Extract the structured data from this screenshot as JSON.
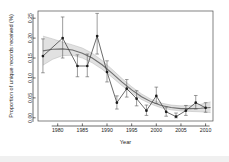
{
  "figure": {
    "background_color": "#ffffff",
    "bottom_band_color": "#f0f0f0"
  },
  "chart_data": {
    "type": "line",
    "title": "",
    "xlabel": "Year",
    "ylabel": "Proportion of unique records received (%)",
    "xlim": [
      1976,
      2011.5
    ],
    "ylim": [
      -0.008,
      0.268
    ],
    "grid": false,
    "legend": null,
    "xticks": [
      1980,
      1985,
      1990,
      1995,
      2000,
      2005,
      2010
    ],
    "xticklabels": [
      "1980",
      "1985",
      "1990",
      "1995",
      "2000",
      "2005",
      "2010"
    ],
    "yticks": [
      0.0,
      0.05,
      0.1,
      0.15,
      0.2,
      0.25
    ],
    "yticklabels": [
      "0.00",
      "0.05",
      "0.10",
      "0.15",
      "0.20",
      "0.25"
    ],
    "series": [
      {
        "name": "observed",
        "style": "line-with-points-and-errorbars",
        "color": "#1c1c1c",
        "x": [
          1977,
          1981,
          1984,
          1986,
          1988,
          1990,
          1992,
          1994,
          1996,
          1998,
          2000,
          2002,
          2004,
          2006,
          2008,
          2010
        ],
        "y": [
          0.155,
          0.2,
          0.13,
          0.13,
          0.205,
          0.115,
          0.038,
          0.073,
          0.048,
          0.018,
          0.055,
          0.015,
          0.003,
          0.018,
          0.038,
          0.025
        ],
        "yerr_low": [
          0.113,
          0.15,
          0.103,
          0.103,
          0.16,
          0.09,
          0.022,
          0.052,
          0.03,
          0.006,
          0.036,
          0.004,
          0.0,
          0.006,
          0.022,
          0.014
        ],
        "yerr_high": [
          0.198,
          0.253,
          0.158,
          0.16,
          0.262,
          0.143,
          0.055,
          0.096,
          0.068,
          0.032,
          0.077,
          0.027,
          0.012,
          0.031,
          0.056,
          0.038
        ]
      },
      {
        "name": "fitted-smooth",
        "style": "line",
        "color": "#6e6e6e",
        "x": [
          1977,
          1979,
          1981,
          1983,
          1985,
          1987,
          1989,
          1991,
          1993,
          1995,
          1997,
          1999,
          2001,
          2003,
          2005,
          2007,
          2009,
          2011
        ],
        "y": [
          0.168,
          0.172,
          0.173,
          0.17,
          0.162,
          0.15,
          0.133,
          0.112,
          0.09,
          0.07,
          0.053,
          0.04,
          0.031,
          0.026,
          0.023,
          0.023,
          0.024,
          0.026
        ]
      },
      {
        "name": "confidence-band",
        "style": "shaded-ribbon",
        "color": "#c9c9c9",
        "x": [
          1977,
          1979,
          1981,
          1983,
          1985,
          1987,
          1989,
          1991,
          1993,
          1995,
          1997,
          1999,
          2001,
          2003,
          2005,
          2007,
          2009,
          2011
        ],
        "y_upper": [
          0.205,
          0.198,
          0.19,
          0.183,
          0.175,
          0.162,
          0.144,
          0.122,
          0.099,
          0.078,
          0.06,
          0.046,
          0.037,
          0.032,
          0.03,
          0.031,
          0.034,
          0.04
        ],
        "y_lower": [
          0.132,
          0.147,
          0.156,
          0.157,
          0.15,
          0.138,
          0.122,
          0.102,
          0.081,
          0.062,
          0.046,
          0.034,
          0.025,
          0.02,
          0.017,
          0.016,
          0.015,
          0.013
        ]
      }
    ]
  }
}
